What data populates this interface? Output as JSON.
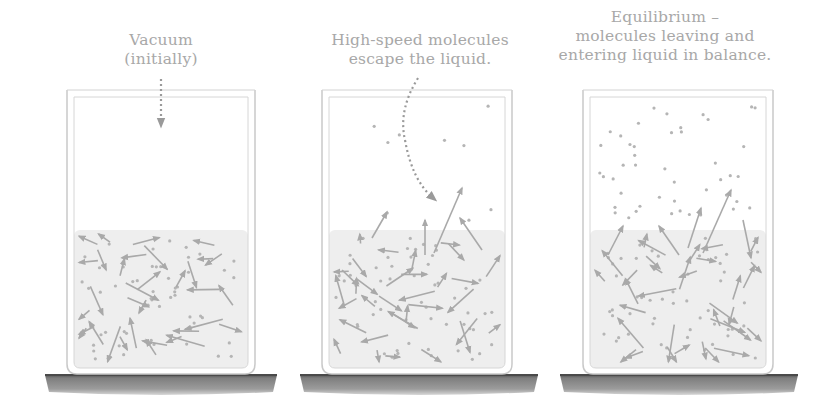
{
  "panels": [
    {
      "id": "vacuum",
      "caption_lines": [
        "Vacuum",
        "(initially)"
      ],
      "caption_center_x": 161,
      "caption_top": 31,
      "beaker": {
        "x": 67,
        "y": 90,
        "w": 188,
        "h": 284
      },
      "liquid_level_y": 230,
      "pointer": "straight-dotted-arrow-down",
      "vapor_molecules": 0
    },
    {
      "id": "evaporation",
      "caption_lines": [
        "High-speed molecules",
        "escape the liquid."
      ],
      "caption_center_x": 420,
      "caption_top": 31,
      "beaker": {
        "x": 322,
        "y": 90,
        "w": 190,
        "h": 284
      },
      "liquid_level_y": 230,
      "pointer": "curved-dotted-arrow",
      "vapor_molecules": 9
    },
    {
      "id": "equilibrium",
      "caption_lines": [
        "Equilibrium –",
        "molecules leaving and",
        "entering liquid in balance."
      ],
      "caption_center_x": 665,
      "caption_top": 8,
      "beaker": {
        "x": 583,
        "y": 90,
        "w": 190,
        "h": 284
      },
      "liquid_level_y": 230,
      "pointer": "none",
      "vapor_molecules": 45
    }
  ],
  "shelves": [
    {
      "x": 45,
      "w": 232
    },
    {
      "x": 300,
      "w": 238
    },
    {
      "x": 560,
      "w": 238
    }
  ],
  "colors": {
    "caption": "#a8a8a8",
    "glass": "#c9c9c9",
    "liquid": "#eeeeee",
    "molecule": "#b5b5b5",
    "arrow": "#a9a9a9",
    "pointer": "#9a9a9a",
    "shelf_top": "#4a4a4a",
    "shelf": "#8e8e8e"
  }
}
